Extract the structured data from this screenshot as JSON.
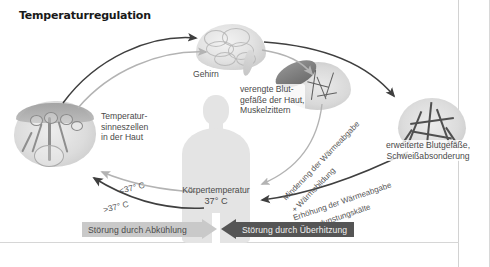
{
  "figure": {
    "title": "Temperaturregulation",
    "language": "de",
    "background_color": "#ffffff",
    "accent_dark": "#555555",
    "accent_light": "#c9c9c9"
  },
  "nodes": {
    "brain": {
      "label": "Gehirn",
      "name": "brain-illustration"
    },
    "skin_sensors": {
      "label": "Temperatur-\nsinneszellen\nin der Haut",
      "name": "skin-sensor-illustration"
    },
    "constricted": {
      "label": "verengte Blut-\ngefäße der Haut,\nMuskelzittern",
      "name": "constricted-vessels-illustration"
    },
    "dilated": {
      "label": "erweiterte Blutgefäße,\nSchweißabsonderung",
      "name": "dilated-vessels-illustration"
    },
    "body": {
      "label": "Körpertemperatur",
      "value": "37° C",
      "name": "body-silhouette"
    }
  },
  "arrow_labels": {
    "below_set_point": "<37° C",
    "above_set_point": ">37° C",
    "heat_loss_reduction": "Minderung der Wärmeabgabe",
    "heat_production": "+ Wärmebildung",
    "heat_loss_increase": "Erhöhung der Wärmeabgabe",
    "evaporative_cooling": "+ Verdunstungskälte"
  },
  "banners": {
    "cooling": "Störung durch Abkühlung",
    "overheating": "Störung durch  Überhitzung"
  }
}
